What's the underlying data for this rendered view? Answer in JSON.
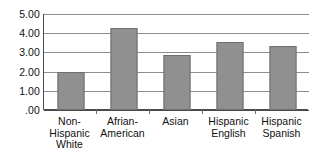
{
  "chart_data": {
    "type": "bar",
    "title": "",
    "xlabel": "",
    "ylabel": "",
    "categories": [
      "Non-Hispanic White",
      "Afrian-American",
      "Asian",
      "Hispanic English",
      "Hispanic Spanish"
    ],
    "category_label_lines": [
      [
        "Non-",
        "Hispanic",
        "White"
      ],
      [
        "Afrian-",
        "American"
      ],
      [
        "Asian"
      ],
      [
        "Hispanic",
        "English"
      ],
      [
        "Hispanic",
        "Spanish"
      ]
    ],
    "values": [
      2.0,
      4.25,
      2.85,
      3.55,
      3.35
    ],
    "ylim": [
      0,
      5
    ],
    "ytick_values": [
      0,
      1,
      2,
      3,
      4,
      5
    ],
    "ytick_labels": [
      ".00",
      "1.00",
      "2.00",
      "3.00",
      "4.00",
      "5.00"
    ],
    "grid": true,
    "legend": "none",
    "colors": {
      "bar_fill": "#909090",
      "bar_border": "#6f6f6f",
      "gridline": "#8d8d8d",
      "axis": "#4a4a4a",
      "text": "#111111",
      "background": "#ffffff"
    }
  }
}
